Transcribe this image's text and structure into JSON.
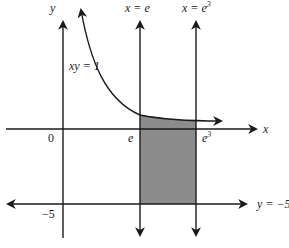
{
  "diagram": {
    "type": "region-between-curves",
    "labels": {
      "y_axis": "y",
      "x_axis": "x",
      "origin": "0",
      "curve": "xy = 1",
      "line_x_e": "x = e",
      "line_x_e3_base": "x = e",
      "line_x_e3_exp": "3",
      "tick_e": "e",
      "tick_e3_base": "e",
      "tick_e3_exp": "3",
      "tick_neg5": "−5",
      "line_y_neg5": "y = −5"
    },
    "colors": {
      "stroke": "#1a1a1a",
      "shade": "#8c8c8c"
    },
    "elements": [
      {
        "name": "x-axis",
        "type": "axis"
      },
      {
        "name": "y-axis",
        "type": "axis"
      },
      {
        "name": "curve xy=1",
        "type": "hyperbola"
      },
      {
        "name": "vertical line x=e"
      },
      {
        "name": "vertical line x=e^3"
      },
      {
        "name": "horizontal line y=-5"
      },
      {
        "name": "shaded region",
        "bounds": "e ≤ x ≤ e^3, -5 ≤ y ≤ 1/x"
      }
    ]
  }
}
